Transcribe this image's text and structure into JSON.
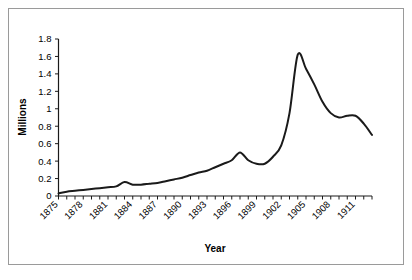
{
  "chart_data": {
    "type": "line",
    "title": "",
    "xlabel": "Year",
    "ylabel": "Millions",
    "ylim": [
      0,
      1.8
    ],
    "xlim": [
      1875,
      1913
    ],
    "grid": false,
    "legend": null,
    "y_ticks": [
      "0",
      "0.2",
      "0.4",
      "0.6",
      "0.8",
      "1",
      "1.2",
      "1.4",
      "1.6",
      "1.8"
    ],
    "y_tick_values": [
      0,
      0.2,
      0.4,
      0.6,
      0.8,
      1.0,
      1.2,
      1.4,
      1.6,
      1.8
    ],
    "x_tick_labels": [
      "1875",
      "1878",
      "1881",
      "1884",
      "1887",
      "1890",
      "1893",
      "1896",
      "1899",
      "1902",
      "1905",
      "1908",
      "1911"
    ],
    "x_tick_label_values": [
      1875,
      1878,
      1881,
      1884,
      1887,
      1890,
      1893,
      1896,
      1899,
      1902,
      1905,
      1908,
      1911
    ],
    "x_tick_label_rotation": 45,
    "x_minor_ticks_every": 1,
    "line_color": "#1a1a1a",
    "line_width": 2,
    "x": [
      1875,
      1876,
      1877,
      1878,
      1879,
      1880,
      1881,
      1882,
      1883,
      1884,
      1885,
      1886,
      1887,
      1888,
      1889,
      1890,
      1891,
      1892,
      1893,
      1894,
      1895,
      1896,
      1897,
      1898,
      1899,
      1900,
      1901,
      1902,
      1903,
      1904,
      1905,
      1906,
      1907,
      1908,
      1909,
      1910,
      1911,
      1912,
      1913
    ],
    "values": [
      0.03,
      0.05,
      0.06,
      0.07,
      0.08,
      0.09,
      0.1,
      0.11,
      0.16,
      0.13,
      0.13,
      0.14,
      0.15,
      0.17,
      0.19,
      0.21,
      0.24,
      0.27,
      0.29,
      0.33,
      0.37,
      0.41,
      0.5,
      0.41,
      0.37,
      0.37,
      0.45,
      0.58,
      0.95,
      1.62,
      1.46,
      1.28,
      1.08,
      0.95,
      0.9,
      0.92,
      0.92,
      0.83,
      0.7
    ],
    "series_name": "Millions"
  },
  "figure": {
    "background_color": "#ffffff",
    "frame_color": "#9a9a9a"
  }
}
